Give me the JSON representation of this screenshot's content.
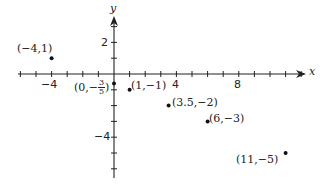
{
  "chart_data": {
    "type": "scatter",
    "title": "",
    "xlabel": "x",
    "ylabel": "y",
    "xlim": [
      -7,
      13
    ],
    "ylim": [
      -6.5,
      3.5
    ],
    "grid": false,
    "x_tick_labels": [
      {
        "value": -4,
        "label": "−4"
      },
      {
        "value": 4,
        "label": "4"
      },
      {
        "value": 8,
        "label": "8"
      }
    ],
    "y_tick_labels": [
      {
        "value": 2,
        "label": "2"
      },
      {
        "value": -4,
        "label": "−4"
      }
    ],
    "x_ticks": [
      -6,
      -5,
      -4,
      -3,
      -2,
      -1,
      1,
      2,
      3,
      4,
      5,
      6,
      7,
      8,
      9,
      10,
      11,
      12
    ],
    "y_ticks": [
      3,
      2,
      1,
      -1,
      -2,
      -3,
      -4,
      -5,
      -6
    ],
    "points": [
      {
        "x": -4,
        "y": 1,
        "label": "(−4,1)"
      },
      {
        "x": 0,
        "y": -0.6,
        "label": "(0,−3/5)"
      },
      {
        "x": 1,
        "y": -1,
        "label": "(1,−1)"
      },
      {
        "x": 3.5,
        "y": -2,
        "label": "(3.5,−2)"
      },
      {
        "x": 6,
        "y": -3,
        "label": "(6,−3)"
      },
      {
        "x": 11,
        "y": -5,
        "label": "(11,−5)"
      }
    ]
  },
  "labels": {
    "p1": "(−4,1)",
    "p2_prefix": "(0,−",
    "p2_num": "3",
    "p2_den": "5",
    "p2_suffix": ")",
    "p3": "(1,−1)",
    "p4": "(3.5,−2)",
    "p5": "(6,−3)",
    "p6": "(11,−5)",
    "x_axis": "x",
    "y_axis": "y",
    "tick_x_neg4": "−4",
    "tick_x_4": "4",
    "tick_x_8": "8",
    "tick_y_2": "2",
    "tick_y_neg4": "−4"
  }
}
